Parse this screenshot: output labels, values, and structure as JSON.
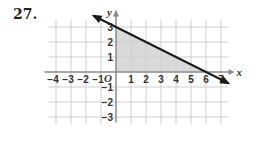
{
  "problem_number": "27.",
  "chart_data": {
    "type": "line",
    "title": "",
    "xlabel": "x",
    "ylabel": "y",
    "origin_label": "O",
    "xlim": [
      -4.5,
      7.5
    ],
    "ylim": [
      -3.5,
      3.5
    ],
    "grid": true,
    "x_ticks": [
      -4,
      -3,
      -2,
      -1,
      1,
      2,
      3,
      4,
      5,
      6,
      7
    ],
    "y_ticks": [
      -3,
      -2,
      -1,
      1,
      2,
      3
    ],
    "series": [
      {
        "name": "boundary line",
        "equation": "y = -x/2 + 3",
        "points": [
          [
            -1.5,
            3.75
          ],
          [
            6,
            0
          ],
          [
            7.5,
            -0.75
          ]
        ],
        "arrows": "both",
        "color": "#1a1a1a"
      }
    ],
    "shaded_region": {
      "vertices": [
        [
          0,
          0
        ],
        [
          0,
          3
        ],
        [
          6,
          0
        ]
      ],
      "color": "#d9d9d9"
    }
  },
  "colors": {
    "grid": "#cfcfcf",
    "axis": "#8a8a8a",
    "line": "#1a1a1a",
    "shade": "#d9d9d9"
  }
}
